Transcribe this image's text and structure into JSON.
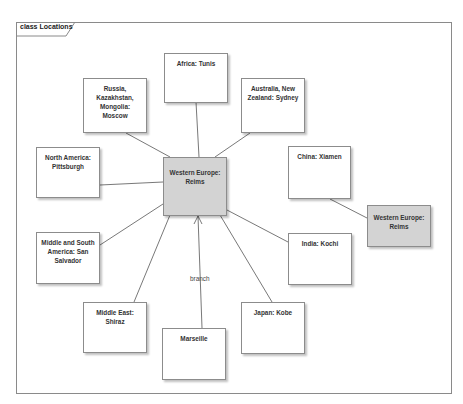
{
  "diagram": {
    "frame_title": "class Locations",
    "colors": {
      "node_fill": "#ffffff",
      "highlight_fill": "#d3d3d3",
      "border": "#8c8c8c",
      "line": "#555555"
    },
    "nodes": [
      {
        "id": "africa",
        "label": "Africa: Tunis"
      },
      {
        "id": "russia",
        "label": "Russia, Kazakhstan, Mongolia: Moscow"
      },
      {
        "id": "australia",
        "label": "Australia, New Zealand: Sydney"
      },
      {
        "id": "north-america",
        "label": "North America: Pittsburgh"
      },
      {
        "id": "western-europe-center",
        "label": "Western Europe: Reims"
      },
      {
        "id": "china",
        "label": "China: Xiamen"
      },
      {
        "id": "western-europe-right",
        "label": "Western Europe: Reims"
      },
      {
        "id": "middle-south-america",
        "label": "Middle and South America: San Salvador"
      },
      {
        "id": "india",
        "label": "India: Kochi"
      },
      {
        "id": "middle-east",
        "label": "Middle East: Shiraz"
      },
      {
        "id": "marseille",
        "label": "Marseille"
      },
      {
        "id": "japan",
        "label": "Japan: Kobe"
      }
    ],
    "edges": [
      {
        "from": "africa",
        "to": "western-europe-center",
        "label": ""
      },
      {
        "from": "russia",
        "to": "western-europe-center",
        "label": ""
      },
      {
        "from": "australia",
        "to": "western-europe-center",
        "label": ""
      },
      {
        "from": "north-america",
        "to": "western-europe-center",
        "label": ""
      },
      {
        "from": "middle-south-america",
        "to": "western-europe-center",
        "label": ""
      },
      {
        "from": "india",
        "to": "western-europe-center",
        "label": ""
      },
      {
        "from": "middle-east",
        "to": "western-europe-center",
        "label": ""
      },
      {
        "from": "japan",
        "to": "western-europe-center",
        "label": ""
      },
      {
        "from": "marseille",
        "to": "western-europe-center",
        "label": "branch",
        "arrow": "open"
      },
      {
        "from": "china",
        "to": "western-europe-right",
        "label": ""
      }
    ]
  }
}
